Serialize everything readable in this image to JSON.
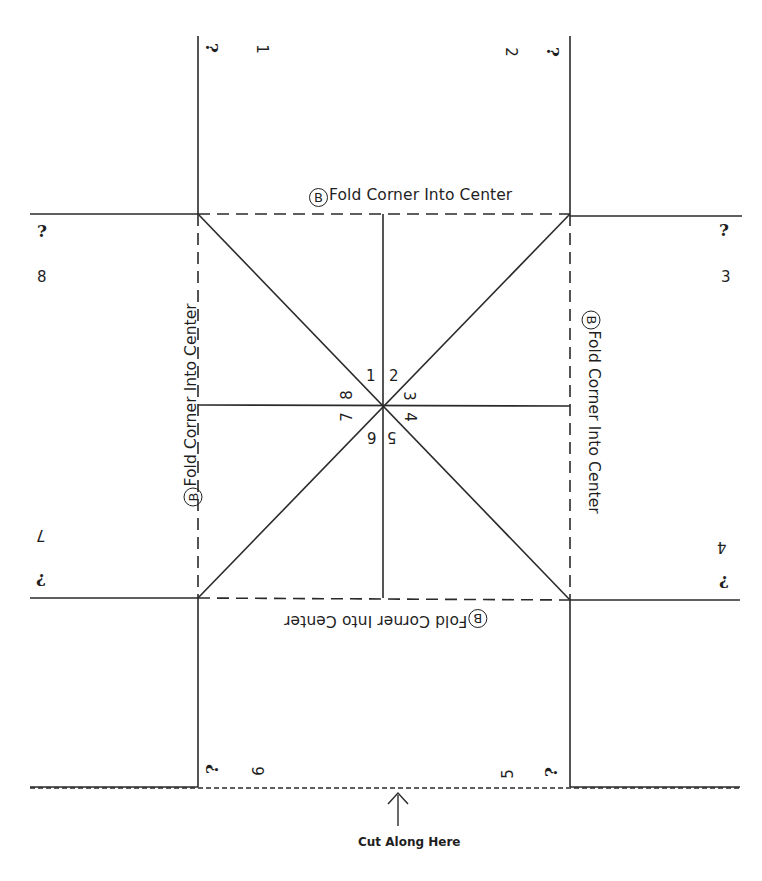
{
  "fold_labels": {
    "circle_letter": "B",
    "text": "Fold Corner Into Center",
    "top": "Fold Corner Into Center",
    "left": "Fold Corner Into Center",
    "right": "Fold Corner Into Center",
    "bottom": "Fold Corner Into Center"
  },
  "center_numbers": [
    "1",
    "2",
    "3",
    "4",
    "5",
    "6",
    "7",
    "8"
  ],
  "flap_numbers": {
    "top_left": "1",
    "top_right": "2",
    "right_top": "3",
    "right_bottom": "4",
    "bottom_right": "5",
    "bottom_left": "6",
    "left_bottom": "7",
    "left_top": "8"
  },
  "question_mark": "?",
  "cut_label": "Cut Along Here",
  "colors": {
    "line": "#2a2a2a",
    "text": "#1f1f1f",
    "background": "#ffffff"
  }
}
